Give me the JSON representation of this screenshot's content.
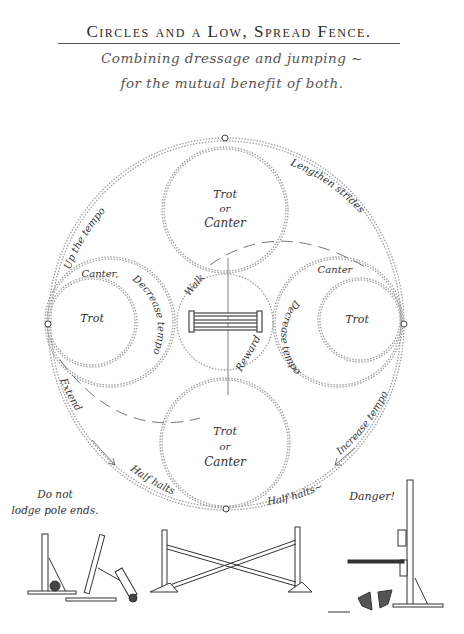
{
  "title": "Circles and a Low, Spread Fence.",
  "subtitle_line1": "Combining dressage and jumping ~",
  "subtitle_line2": "for the mutual benefit of both.",
  "diagram": {
    "circle_top": {
      "line1": "Trot",
      "line2": "or",
      "line3": "Canter"
    },
    "circle_bottom": {
      "line1": "Trot",
      "line2": "or",
      "line3": "Canter"
    },
    "circle_left": {
      "outer": "Canter,",
      "inner": "Trot",
      "arc": "Decrease tempo"
    },
    "circle_right": {
      "outer": "Canter",
      "inner": "Trot",
      "arc": "Decrease tempo"
    },
    "center": {
      "walk": "Walk",
      "reward": "Reward"
    },
    "outer_labels": {
      "upper_left": "Up the tempo",
      "upper_right": "Lengthen strides",
      "lower_left": "Extend",
      "lower_right": "Increase tempo",
      "bottom_left": "Half halts",
      "bottom_right": "Half halts~"
    }
  },
  "illustrations": {
    "left_caption_line1": "Do not",
    "left_caption_line2": "lodge pole ends.",
    "right_caption": "Danger!"
  },
  "colors": {
    "ink": "#333333",
    "dotted": "#9a9a9a",
    "paper": "#ffffff"
  }
}
